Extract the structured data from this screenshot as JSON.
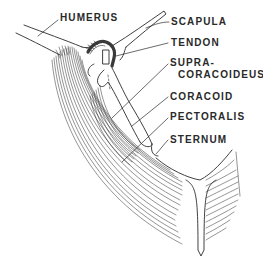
{
  "diagram": {
    "type": "anatomical illustration",
    "background": "#ffffff",
    "ink_color": "#2a2a2a",
    "labels": [
      {
        "id": "humerus",
        "text": "HUMERUS",
        "x": 60,
        "y": 13
      },
      {
        "id": "scapula",
        "text": "SCAPULA",
        "x": 171,
        "y": 17
      },
      {
        "id": "tendon",
        "text": "TENDON",
        "x": 171,
        "y": 38
      },
      {
        "id": "supra",
        "text": "SUPRA-",
        "x": 170,
        "y": 58
      },
      {
        "id": "coracoideus",
        "text": "CORACOIDEUS",
        "x": 178,
        "y": 70
      },
      {
        "id": "coracoid",
        "text": "CORACOID",
        "x": 170,
        "y": 92
      },
      {
        "id": "pectoralis",
        "text": "PECTORALIS",
        "x": 170,
        "y": 112
      },
      {
        "id": "sternum",
        "text": "STERNUM",
        "x": 170,
        "y": 135
      }
    ]
  }
}
